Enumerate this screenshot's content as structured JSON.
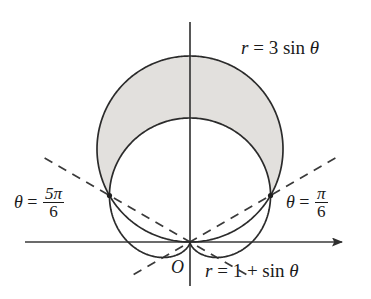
{
  "figure": {
    "background_color": "#ffffff",
    "curve_color": "#2b2b2b",
    "axis_color": "#3a3a3a",
    "shade_color": "#e2e0dd",
    "dash_color": "#3a3a3a",
    "origin_px": {
      "x": 190,
      "y": 242
    }
  },
  "labels": {
    "circle": {
      "r": "r",
      "eq": "=",
      "coef": "3",
      "fn": "sin",
      "theta": "θ"
    },
    "cardioid": {
      "r": "r",
      "eq": "=",
      "one": "1",
      "plus": "+",
      "fn": "sin",
      "theta": "θ"
    },
    "theta_left": {
      "theta": "θ",
      "eq": "=",
      "num": "5π",
      "den": "6"
    },
    "theta_right": {
      "theta": "θ",
      "eq": "=",
      "num": "π",
      "den": "6"
    },
    "origin": "O"
  },
  "chart_data": {
    "type": "line",
    "title": "",
    "coordinate_system": "polar",
    "xlabel": "",
    "ylabel": "",
    "grid": false,
    "legend_position": "none",
    "axes": {
      "x_axis": {
        "from_px": [
          25,
          242
        ],
        "to_px": [
          347,
          242
        ],
        "arrow_end": "right"
      },
      "y_axis": {
        "from_px": [
          190,
          22
        ],
        "to_px": [
          190,
          286
        ],
        "arrow_end": "none"
      }
    },
    "scale_px_per_unit": 62,
    "series": [
      {
        "name": "r = 3 sin θ",
        "equation": "r = 3 sin(theta)",
        "shape": "circle",
        "radius_units": 1.5,
        "center_units": [
          0,
          1.5
        ],
        "max_r": 3,
        "style": "solid"
      },
      {
        "name": "r = 1 + sin θ",
        "equation": "r = 1 + sin(theta)",
        "shape": "cardioid",
        "max_r": 2,
        "min_r": 0,
        "cusp_at": "theta = 3pi/2",
        "style": "solid"
      }
    ],
    "rays": [
      {
        "name": "θ = π/6",
        "angle_deg": 30,
        "style": "dashed"
      },
      {
        "name": "θ = 5π/6",
        "angle_deg": 150,
        "style": "dashed"
      }
    ],
    "intersections": [
      {
        "theta": "pi/6",
        "r": 1.5,
        "px": [
          272,
          192
        ]
      },
      {
        "theta": "5pi/6",
        "r": 1.5,
        "px": [
          108,
          192
        ]
      },
      {
        "theta": "origin",
        "r": 0,
        "px": [
          190,
          242
        ]
      }
    ],
    "shaded_region": {
      "description": "Region inside r = 3 sin theta and outside r = 1 + sin theta",
      "theta_range_deg": [
        30,
        150
      ],
      "outer_curve": "r = 3 sin θ",
      "inner_curve": "r = 1 + sin θ",
      "fill": "#e2e0dd"
    }
  }
}
